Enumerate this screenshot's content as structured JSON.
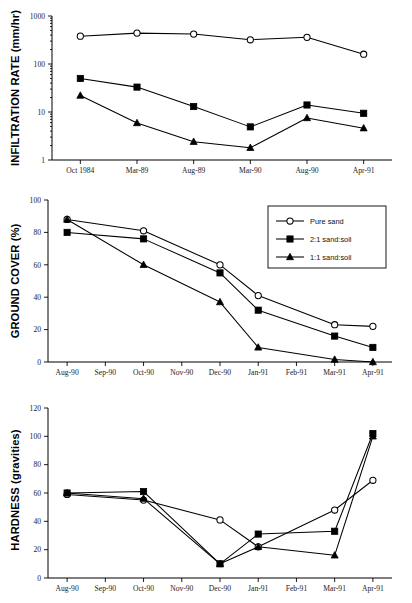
{
  "figure": {
    "background": "#ffffff",
    "ink": "#000000"
  },
  "legend": {
    "position": "top-right-of-middle-panel",
    "entries": [
      {
        "label": "Pure sand",
        "marker": "open-circle"
      },
      {
        "label": "2:1 sand:soil",
        "marker": "filled-square"
      },
      {
        "label": "1:1 sand:soil",
        "marker": "filled-triangle"
      }
    ]
  },
  "chart_data": [
    {
      "id": "infiltration",
      "type": "line",
      "title": "",
      "xlabel": "",
      "ylabel": "INFILTRATION RATE (mm/hr)",
      "yscale": "log",
      "ylim": [
        1,
        1000
      ],
      "yticks": [
        1,
        10,
        100,
        1000
      ],
      "ytick_labels": [
        "1",
        "10",
        "100",
        "1000"
      ],
      "grid": false,
      "categories": [
        "Oct 1984",
        "Mar-89",
        "Aug-89",
        "Mar-90",
        "Aug-90",
        "Apr-91"
      ],
      "series": [
        {
          "name": "Pure sand",
          "marker": "open-circle",
          "values": [
            380,
            440,
            420,
            320,
            360,
            160
          ]
        },
        {
          "name": "2:1 sand:soil",
          "marker": "filled-square",
          "values": [
            50,
            33,
            13,
            4.9,
            14,
            9.4
          ]
        },
        {
          "name": "1:1 sand:soil",
          "marker": "filled-triangle",
          "values": [
            22,
            5.9,
            2.4,
            1.8,
            7.5,
            4.6
          ]
        }
      ]
    },
    {
      "id": "ground-cover",
      "type": "line",
      "title": "",
      "xlabel": "",
      "ylabel": "GROUND COVER (%)",
      "yscale": "linear",
      "ylim": [
        0,
        100
      ],
      "yticks": [
        0,
        20,
        40,
        60,
        80,
        100
      ],
      "ytick_labels": [
        "0",
        "20",
        "40",
        "60",
        "80",
        "100"
      ],
      "grid": false,
      "categories": [
        "Aug-90",
        "Sep-90",
        "Oct-90",
        "Nov-90",
        "Dec-90",
        "Jan-91",
        "Feb-91",
        "Mar-91",
        "Apr-91"
      ],
      "series": [
        {
          "name": "Pure sand",
          "marker": "open-circle",
          "values": [
            88,
            null,
            81,
            null,
            60,
            41,
            null,
            23,
            22
          ]
        },
        {
          "name": "2:1 sand:soil",
          "marker": "filled-square",
          "values": [
            80,
            null,
            76,
            null,
            55,
            32,
            null,
            16,
            9
          ]
        },
        {
          "name": "1:1 sand:soil",
          "marker": "filled-triangle",
          "values": [
            88,
            null,
            60,
            null,
            37,
            9,
            null,
            1.5,
            0
          ]
        }
      ]
    },
    {
      "id": "hardness",
      "type": "line",
      "title": "",
      "xlabel": "",
      "ylabel": "HARDNESS (gravities)",
      "yscale": "linear",
      "ylim": [
        0,
        120
      ],
      "yticks": [
        0,
        20,
        40,
        60,
        80,
        100,
        120
      ],
      "ytick_labels": [
        "0",
        "20",
        "40",
        "60",
        "80",
        "100",
        "120"
      ],
      "grid": false,
      "categories": [
        "Aug-90",
        "Sep-90",
        "Oct-90",
        "Nov-90",
        "Dec-90",
        "Jan-91",
        "Feb-91",
        "Mar-91",
        "Apr-91"
      ],
      "series": [
        {
          "name": "Pure sand",
          "marker": "open-circle",
          "values": [
            59,
            null,
            55,
            null,
            41,
            22,
            null,
            48,
            69
          ]
        },
        {
          "name": "2:1 sand:soil",
          "marker": "filled-square",
          "values": [
            60,
            null,
            61,
            null,
            10,
            31,
            null,
            33,
            102
          ]
        },
        {
          "name": "1:1 sand:soil",
          "marker": "filled-triangle",
          "values": [
            60,
            null,
            56,
            null,
            10,
            22,
            null,
            16,
            100
          ]
        }
      ]
    }
  ]
}
